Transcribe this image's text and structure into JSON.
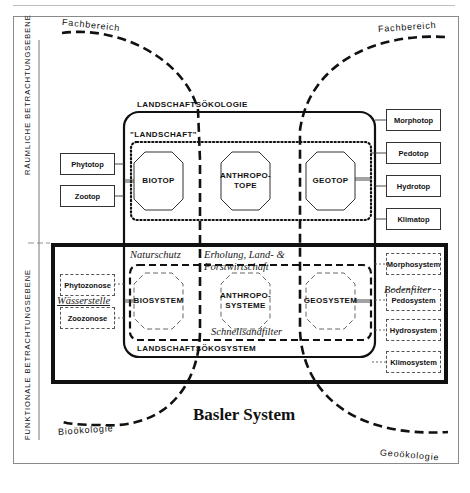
{
  "title": "Basler System",
  "axes_labels": {
    "spatial": "RÄUMLICHE BETRACHTUNGSEBENE",
    "functional": "FUNKTIONALE BETRACHTUNGSEBENE"
  },
  "curve_labels": {
    "top_left": "Fachbereich",
    "top_right": "Fachbereich",
    "bottom_left": "Bioökologie",
    "bottom_right": "Geoökologie"
  },
  "upper": {
    "outer_label": "LANDSCHAFTSÖKOLOGIE",
    "inner_label": "\"LANDSCHAFT\"",
    "center_boxes": [
      "BIOTOP",
      "ANTHROPO-\nTOPE",
      "GEOTOP"
    ],
    "left_boxes": [
      "Phytotop",
      "Zootop"
    ],
    "right_boxes": [
      "Morphotop",
      "Pedotop",
      "Hydrotop",
      "Klimatop"
    ]
  },
  "lower": {
    "outer_label": "LANDSCHAFTSÖKOSYSTEM",
    "center_boxes": [
      "BIOSYSTEM",
      "ANTHROPO-\nSYSTEME",
      "GEOSYSTEM"
    ],
    "left_boxes": [
      "Phytozonose",
      "Zoozonose"
    ],
    "right_boxes": [
      "Morphosystem",
      "Pedosystem",
      "Hydrosystem",
      "Klimosystem"
    ]
  },
  "annotations": {
    "naturschutz": "Naturschutz",
    "erholung_1": "Erholung, Land- &",
    "erholung_2": "Forstwirtschaft",
    "wasserstelle": "Wässerstelle",
    "schnellsandfilter": "Schnellsandfilter",
    "bodenfilter": "Bodenfilter"
  },
  "colors": {
    "ink": "#111111",
    "frame": "#8a8a8a",
    "light": "#555555"
  }
}
